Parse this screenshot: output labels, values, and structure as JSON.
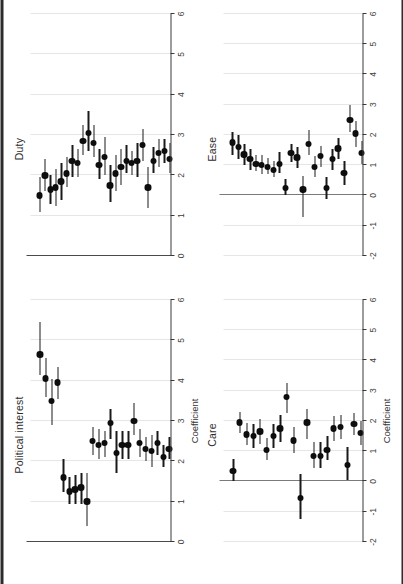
{
  "figure": {
    "orientation": "rotated-90",
    "panel_order": [
      "political_interest",
      "duty",
      "care",
      "ease"
    ],
    "point_color": "#0d0d0d",
    "grid_color": "#e6e6e6",
    "axis_color": "#3a3a3a",
    "zero_line_color": "#7a7a7a"
  },
  "chart_data": [
    {
      "type": "scatter",
      "id": "political_interest",
      "title": "Political interest",
      "xlabel": "Coefficient",
      "ylabel": "",
      "xlim": [
        0,
        6
      ],
      "ticks": [
        0,
        1,
        2,
        3,
        4,
        5,
        6
      ],
      "ticklabels": [
        "0",
        "1",
        "2",
        "3",
        "4",
        "5",
        "6"
      ],
      "grid": true,
      "zero_line": false,
      "estimates": [
        4.65,
        4.05,
        3.5,
        3.95,
        1.6,
        1.25,
        1.3,
        1.35,
        1.0,
        2.5,
        2.4,
        2.45,
        2.95,
        2.2,
        2.4,
        2.4,
        3.0,
        2.45,
        2.3,
        2.25,
        2.45,
        2.1,
        2.3
      ],
      "ci_low": [
        4.15,
        3.6,
        2.9,
        3.55,
        1.25,
        0.95,
        0.95,
        0.95,
        0.4,
        2.15,
        2.05,
        2.1,
        2.55,
        1.7,
        2.05,
        2.05,
        2.65,
        2.1,
        2.0,
        1.85,
        2.15,
        1.85,
        2.05
      ],
      "ci_high": [
        5.45,
        4.55,
        4.05,
        4.35,
        2.05,
        1.6,
        1.65,
        1.7,
        1.7,
        2.85,
        2.8,
        2.75,
        3.3,
        2.75,
        2.75,
        2.75,
        3.45,
        2.8,
        2.6,
        2.65,
        2.75,
        2.4,
        2.6
      ]
    },
    {
      "type": "scatter",
      "id": "duty",
      "title": "Duty",
      "xlabel": "",
      "ylabel": "",
      "xlim": [
        0,
        6
      ],
      "ticks": [
        0,
        1,
        2,
        3,
        4,
        5,
        6
      ],
      "ticklabels": [
        "0",
        "1",
        "2",
        "3",
        "4",
        "5",
        "6"
      ],
      "grid": true,
      "zero_line": false,
      "estimates": [
        1.5,
        2.0,
        1.65,
        1.7,
        1.85,
        2.05,
        2.35,
        2.3,
        2.85,
        3.05,
        2.8,
        2.25,
        2.45,
        1.75,
        2.05,
        2.2,
        2.35,
        2.3,
        2.35,
        2.75,
        1.7,
        2.35,
        2.55,
        2.6,
        2.4
      ],
      "ci_low": [
        1.1,
        1.6,
        1.3,
        1.25,
        1.4,
        1.7,
        1.95,
        1.95,
        2.5,
        2.6,
        2.45,
        1.9,
        2.0,
        1.35,
        1.6,
        1.75,
        2.05,
        2.0,
        1.95,
        2.35,
        1.2,
        2.05,
        2.2,
        2.3,
        2.05
      ],
      "ci_high": [
        1.95,
        2.4,
        2.0,
        2.15,
        2.3,
        2.45,
        2.75,
        2.65,
        3.25,
        3.6,
        3.25,
        2.65,
        2.95,
        2.25,
        2.5,
        2.65,
        2.75,
        2.6,
        2.8,
        3.15,
        2.2,
        2.7,
        2.9,
        2.9,
        2.8
      ]
    },
    {
      "type": "scatter",
      "id": "care",
      "title": "Care",
      "xlabel": "Coefficient",
      "ylabel": "",
      "xlim": [
        -2,
        6
      ],
      "ticks": [
        -2,
        -1,
        0,
        1,
        2,
        3,
        4,
        5,
        6
      ],
      "ticklabels": [
        "-2",
        "-1",
        "0",
        "1",
        "2",
        "3",
        "4",
        "5",
        "6"
      ],
      "grid": true,
      "zero_line": true,
      "estimates": [
        0.35,
        1.95,
        1.55,
        1.5,
        1.65,
        1.05,
        1.5,
        1.75,
        2.8,
        1.35,
        -0.55,
        1.95,
        0.85,
        0.85,
        1.05,
        1.75,
        1.8,
        0.55,
        1.9,
        1.6
      ],
      "ci_low": [
        0.0,
        1.6,
        1.2,
        1.1,
        1.25,
        0.7,
        1.1,
        1.3,
        2.25,
        0.95,
        -1.25,
        1.4,
        0.45,
        0.45,
        0.7,
        1.35,
        1.4,
        0.05,
        1.55,
        1.2
      ],
      "ci_high": [
        0.75,
        2.3,
        1.95,
        1.9,
        2.05,
        1.45,
        1.9,
        2.2,
        3.25,
        1.8,
        0.25,
        2.4,
        1.3,
        1.3,
        1.5,
        2.15,
        2.2,
        1.15,
        2.25,
        2.0
      ]
    },
    {
      "type": "scatter",
      "id": "ease",
      "title": "Ease",
      "xlabel": "",
      "ylabel": "",
      "xlim": [
        -2,
        6
      ],
      "ticks": [
        -2,
        -1,
        0,
        1,
        2,
        3,
        4,
        5,
        6
      ],
      "ticklabels": [
        "-2",
        "-1",
        "0",
        "1",
        "2",
        "3",
        "4",
        "5",
        "6"
      ],
      "grid": true,
      "zero_line": true,
      "estimates": [
        1.75,
        1.6,
        1.35,
        1.2,
        1.05,
        1.0,
        0.95,
        0.85,
        1.05,
        0.25,
        1.4,
        1.25,
        0.2,
        1.7,
        0.95,
        1.3,
        0.25,
        1.2,
        1.55,
        0.75,
        2.5,
        2.05,
        1.4
      ],
      "ci_low": [
        1.35,
        1.2,
        1.0,
        0.85,
        0.8,
        0.7,
        0.7,
        0.6,
        0.75,
        0.0,
        1.1,
        0.9,
        -0.7,
        1.35,
        0.6,
        0.95,
        -0.1,
        0.85,
        1.2,
        0.35,
        2.1,
        1.6,
        1.05
      ],
      "ci_high": [
        2.1,
        2.0,
        1.7,
        1.55,
        1.35,
        1.35,
        1.25,
        1.15,
        1.45,
        0.55,
        1.7,
        1.6,
        0.65,
        2.15,
        1.3,
        1.65,
        0.6,
        1.55,
        1.9,
        1.15,
        3.0,
        2.45,
        1.8
      ]
    }
  ]
}
